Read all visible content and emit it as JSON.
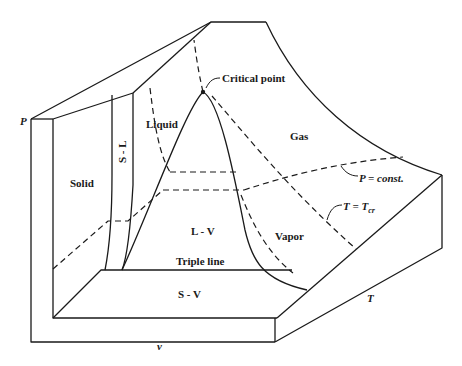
{
  "diagram": {
    "type": "P-v-T surface",
    "axes": {
      "pressure": "P",
      "volume": "v",
      "temperature": "T"
    },
    "regions": {
      "solid": "Solid",
      "solid_liquid": "S - L",
      "liquid": "Liquid",
      "gas": "Gas",
      "liquid_vapor": "L - V",
      "vapor": "Vapor",
      "solid_vapor": "S - V"
    },
    "annotations": {
      "critical_point": "Critical point",
      "triple_line": "Triple line",
      "isobar": "P = const.",
      "critical_isotherm_T": "T = T",
      "critical_isotherm_sub": "cr"
    },
    "colors": {
      "ink": "#1a1a1a",
      "background": "#ffffff"
    }
  }
}
